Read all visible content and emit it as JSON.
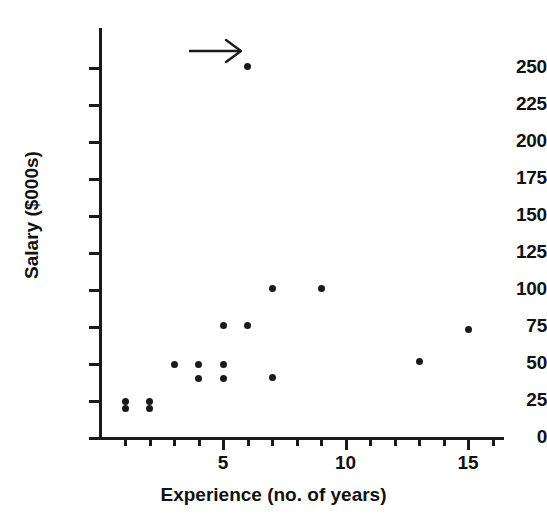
{
  "chart_data": {
    "type": "scatter",
    "title": "",
    "xlabel": "Experience (no. of years)",
    "ylabel": "Salary ($000s)",
    "xlim": [
      0,
      16.5
    ],
    "ylim": [
      0,
      262
    ],
    "grid": false,
    "legend": null,
    "x_ticks_major": [
      5,
      10,
      15
    ],
    "x_tick_labels": [
      "5",
      "10",
      "15"
    ],
    "x_ticks_minor": [
      1,
      2,
      3,
      4,
      6,
      7,
      8,
      9,
      11,
      12,
      13,
      14,
      16
    ],
    "y_ticks": [
      0,
      25,
      50,
      75,
      100,
      125,
      150,
      175,
      200,
      225,
      250
    ],
    "y_tick_labels": [
      "0",
      "25",
      "50",
      "75",
      "100",
      "125",
      "150",
      "175",
      "200",
      "225",
      "250"
    ],
    "marker": "filled-circle",
    "marker_color": "#1a1a1a",
    "points": [
      {
        "x": 1,
        "y": 25
      },
      {
        "x": 1,
        "y": 20
      },
      {
        "x": 2,
        "y": 25
      },
      {
        "x": 2,
        "y": 20
      },
      {
        "x": 3,
        "y": 50
      },
      {
        "x": 4,
        "y": 50
      },
      {
        "x": 4,
        "y": 40
      },
      {
        "x": 5,
        "y": 50
      },
      {
        "x": 5,
        "y": 40
      },
      {
        "x": 5,
        "y": 76
      },
      {
        "x": 6,
        "y": 76
      },
      {
        "x": 7,
        "y": 101
      },
      {
        "x": 7,
        "y": 41
      },
      {
        "x": 9,
        "y": 101
      },
      {
        "x": 13,
        "y": 52
      },
      {
        "x": 15,
        "y": 73
      },
      {
        "x": 6,
        "y": 251
      }
    ],
    "annotations": [
      {
        "type": "arrow",
        "name": "outlier-arrow",
        "points_to": {
          "x": 6,
          "y": 251
        },
        "direction": "right",
        "label": ""
      }
    ]
  },
  "axes": {
    "x_title": "Experience (no. of years)",
    "y_title": "Salary ($000s)"
  },
  "colors": {
    "axis": "#1a1a1a",
    "marker": "#1a1a1a",
    "text": "#111111",
    "background": "#ffffff"
  }
}
